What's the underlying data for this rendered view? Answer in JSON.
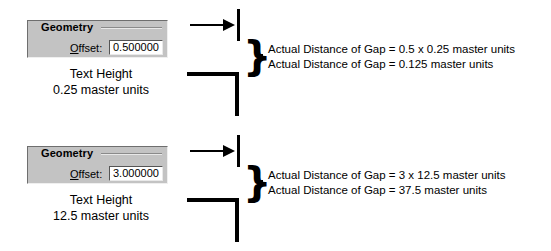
{
  "examples": [
    {
      "id": "example-small-text",
      "dialog": {
        "group_title": "Geometry",
        "field_label": "Offset:",
        "field_label_mnemonic": "O",
        "field_value": "0.500000"
      },
      "caption_line1": "Text Height",
      "caption_line2": "0.25 master units",
      "annotation_line1": "Actual Distance of Gap = 0.5 x 0.25 master units",
      "annotation_line2": "Actual Distance of Gap = 0.125 master units",
      "diagram": {
        "arrow_icon": "right-arrow-icon",
        "brace_icon": "curly-brace-icon",
        "glyph_brace": "}"
      }
    },
    {
      "id": "example-large-text",
      "dialog": {
        "group_title": "Geometry",
        "field_label": "Offset:",
        "field_label_mnemonic": "O",
        "field_value": "3.000000"
      },
      "caption_line1": "Text Height",
      "caption_line2": "12.5 master units",
      "annotation_line1": "Actual Distance of Gap = 3 x 12.5 master units",
      "annotation_line2": "Actual Distance of Gap = 37.5 master units",
      "diagram": {
        "arrow_icon": "right-arrow-icon",
        "brace_icon": "curly-brace-icon",
        "glyph_brace": "}"
      }
    }
  ],
  "colors": {
    "dialog_face": "#c3c3c3",
    "ink": "#000000",
    "background": "#ffffff",
    "input_face": "#ffffff"
  }
}
